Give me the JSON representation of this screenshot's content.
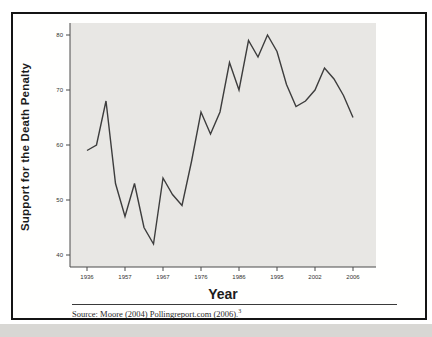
{
  "figure": {
    "y_axis_label": "Support for the Death Penalty",
    "x_axis_label": "Year",
    "source_note": "Source: Moore (2004) Pollingreport.com (2006).",
    "source_footnote_marker": "3"
  },
  "chart_data": {
    "type": "line",
    "title": "",
    "xlabel": "Year",
    "ylabel": "Support for the Death Penalty",
    "x": [
      1936,
      1937,
      1953,
      1956,
      1957,
      1960,
      1965,
      1966,
      1967,
      1969,
      1971,
      1972,
      1976,
      1978,
      1981,
      1985,
      1986,
      1988,
      1991,
      1994,
      1995,
      1999,
      2000,
      2001,
      2002,
      2003,
      2004,
      2005,
      2006
    ],
    "values": [
      59,
      60,
      68,
      53,
      47,
      53,
      45,
      42,
      54,
      51,
      49,
      57,
      66,
      62,
      66,
      75,
      70,
      79,
      76,
      80,
      77,
      71,
      67,
      68,
      70,
      74,
      72,
      69,
      65
    ],
    "x_scale": "ordinal-evenly-spaced-polls",
    "x_tick_indices": [
      0,
      4,
      8,
      12,
      16,
      20,
      24,
      28
    ],
    "x_tick_labels": [
      "1936",
      "1957",
      "1967",
      "1976",
      "1986",
      "1995",
      "2002",
      "2006"
    ],
    "y_ticks": [
      40,
      50,
      60,
      70,
      80
    ],
    "ylim": [
      37.8,
      82.2
    ],
    "grid": false,
    "legend_position": "none",
    "colors": {
      "line": "#3d3d3d",
      "plot_background": "#e8e7e4",
      "axis": "#4a4a4a",
      "tick_label": "#333333",
      "frame_border": "#141414"
    }
  }
}
